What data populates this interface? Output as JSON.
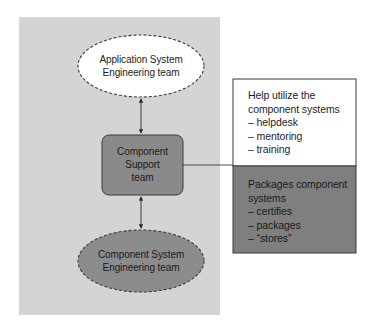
{
  "colors": {
    "background": "#ffffff",
    "panel": "#d4d4d4",
    "app_ellipse_fill": "#ffffff",
    "support_box_fill": "#8a8a8a",
    "component_ellipse_fill": "#8c8c8c",
    "help_box_fill": "#ffffff",
    "packages_box_fill": "#7f7f7f",
    "stroke": "#3a3a3a"
  },
  "nodes": {
    "app_team": {
      "lines": [
        "Application System",
        "Engineering team"
      ],
      "shape": "ellipse-dashed"
    },
    "support_team": {
      "lines": [
        "Component",
        "Support",
        "team"
      ],
      "shape": "rounded-rect"
    },
    "component_team": {
      "lines": [
        "Component System",
        "Engineering team"
      ],
      "shape": "ellipse-dashed"
    }
  },
  "help_box": {
    "lines": [
      "Help utilize the",
      "component systems",
      "– helpdesk",
      "– mentoring",
      "– training"
    ]
  },
  "packages_box": {
    "lines": [
      "Packages component",
      "systems",
      "– certifies",
      "– packages",
      "– “stores”"
    ]
  },
  "edges": [
    {
      "from": "app_team",
      "to": "support_team",
      "type": "bidirectional-arrow"
    },
    {
      "from": "support_team",
      "to": "component_team",
      "type": "bidirectional-arrow"
    },
    {
      "from": "support_team",
      "to": "help_box/packages_box",
      "type": "line"
    }
  ]
}
